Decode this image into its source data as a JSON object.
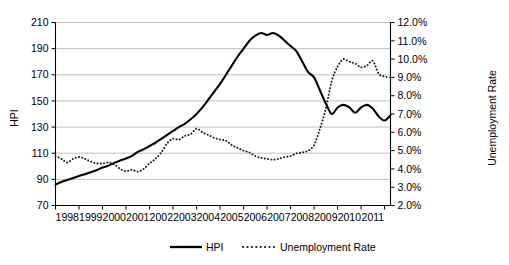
{
  "chart_data": {
    "type": "line",
    "title": "",
    "xlabel": "",
    "ylabel": "HPI",
    "y2label": "Unemployment Rate",
    "grid": true,
    "legend_position": "bottom",
    "xlim": [
      1997.5,
      2011.75
    ],
    "ylim": [
      70,
      210
    ],
    "y2lim": [
      0.02,
      0.12
    ],
    "y_ticks": [
      70,
      90,
      110,
      130,
      150,
      170,
      190,
      210
    ],
    "y_tick_labels": [
      "70",
      "90",
      "110",
      "130",
      "150",
      "170",
      "190",
      "210"
    ],
    "y2_ticks": [
      0.02,
      0.03,
      0.04,
      0.05,
      0.06,
      0.07,
      0.08,
      0.09,
      0.1,
      0.11,
      0.12
    ],
    "y2_tick_labels": [
      "2.0%",
      "3.0%",
      "4.0%",
      "5.0%",
      "6.0%",
      "7.0%",
      "8.0%",
      "9.0%",
      "10.0%",
      "11.0%",
      "12.0%"
    ],
    "x_tick_labels": [
      "1998",
      "1999",
      "2000",
      "2001",
      "2002",
      "2003",
      "2004",
      "2005",
      "2006",
      "2007",
      "2008",
      "2009",
      "2010",
      "2011"
    ],
    "x_tick_values": [
      1998,
      1999,
      2000,
      2001,
      2002,
      2003,
      2004,
      2005,
      2006,
      2007,
      2008,
      2009,
      2010,
      2011
    ],
    "x": [
      1997.5,
      1997.75,
      1998.0,
      1998.25,
      1998.5,
      1998.75,
      1999.0,
      1999.25,
      1999.5,
      1999.75,
      2000.0,
      2000.25,
      2000.5,
      2000.75,
      2001.0,
      2001.25,
      2001.5,
      2001.75,
      2002.0,
      2002.25,
      2002.5,
      2002.75,
      2003.0,
      2003.25,
      2003.5,
      2003.75,
      2004.0,
      2004.25,
      2004.5,
      2004.75,
      2005.0,
      2005.25,
      2005.5,
      2005.75,
      2006.0,
      2006.25,
      2006.5,
      2006.75,
      2007.0,
      2007.25,
      2007.5,
      2007.75,
      2008.0,
      2008.25,
      2008.5,
      2008.75,
      2009.0,
      2009.25,
      2009.5,
      2009.75,
      2010.0,
      2010.25,
      2010.5,
      2010.75,
      2011.0,
      2011.25,
      2011.5,
      2011.75
    ],
    "series": [
      {
        "name": "HPI",
        "style": "solid",
        "axis": "left",
        "color": "#000000",
        "values": [
          86,
          88,
          89.5,
          91,
          92.5,
          94,
          95.5,
          97,
          99,
          100.5,
          102.5,
          104.5,
          106,
          108,
          111,
          113,
          115.5,
          118,
          121,
          124,
          127,
          130,
          132.5,
          136,
          140,
          145,
          151,
          157,
          163,
          170,
          177,
          184,
          190,
          196,
          200,
          202,
          200.5,
          202,
          200,
          196,
          192,
          188,
          180,
          172,
          168,
          158,
          148,
          140,
          145,
          147,
          145,
          141,
          145,
          147,
          144,
          138,
          135,
          139
        ]
      },
      {
        "name": "Unemployment Rate",
        "style": "dotted",
        "axis": "right",
        "color": "#1a1a1a",
        "values": [
          0.047,
          0.0455,
          0.0435,
          0.0455,
          0.0465,
          0.0455,
          0.044,
          0.043,
          0.043,
          0.0435,
          0.0425,
          0.04,
          0.0388,
          0.0395,
          0.0385,
          0.04,
          0.043,
          0.0455,
          0.049,
          0.054,
          0.0565,
          0.056,
          0.058,
          0.059,
          0.062,
          0.06,
          0.0585,
          0.057,
          0.056,
          0.0555,
          0.053,
          0.0515,
          0.05,
          0.049,
          0.047,
          0.046,
          0.0455,
          0.045,
          0.0455,
          0.0465,
          0.047,
          0.0485,
          0.049,
          0.05,
          0.053,
          0.062,
          0.073,
          0.088,
          0.096,
          0.1,
          0.0985,
          0.0975,
          0.0955,
          0.0965,
          0.099,
          0.092,
          0.0905,
          0.09
        ]
      }
    ],
    "legend": [
      {
        "label": "HPI",
        "style": "solid"
      },
      {
        "label": "Unemployment Rate",
        "style": "dotted"
      }
    ]
  },
  "labels": {
    "y_axis_title": "HPI",
    "y2_axis_title": "Unemployment Rate"
  }
}
